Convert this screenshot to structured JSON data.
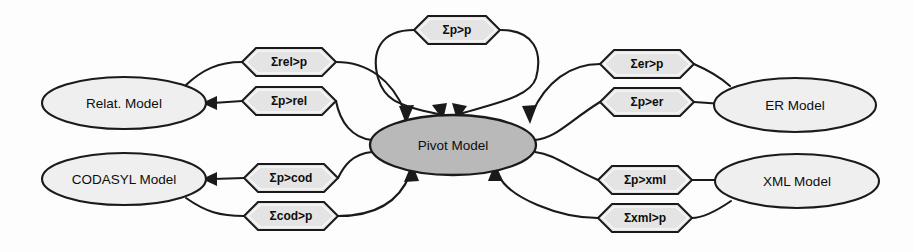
{
  "diagram": {
    "type": "pivot-model-transformation-diagram",
    "background_color": "#fdfdfd",
    "stroke_color": "#1a1a1a",
    "node_fill_color": "#efefef",
    "pivot_fill_color": "#b9b9b9",
    "hexagon_fill_color": "#e4e4e4",
    "nodes": [
      {
        "id": "relational",
        "label": "Relat. Model",
        "position": "top-left",
        "cx": 124,
        "cy": 103,
        "rx": 82,
        "ry": 26
      },
      {
        "id": "codasyl",
        "label": "CODASYL Model",
        "position": "bottom-left",
        "cx": 124,
        "cy": 179,
        "rx": 82,
        "ry": 26
      },
      {
        "id": "pivot",
        "label": "Pivot Model",
        "position": "center",
        "cx": 453,
        "cy": 145,
        "rx": 83,
        "ry": 30
      },
      {
        "id": "er",
        "label": "ER Model",
        "position": "top-right",
        "cx": 795,
        "cy": 105,
        "rx": 81,
        "ry": 27
      },
      {
        "id": "xml",
        "label": "XML Model",
        "position": "bottom-right",
        "cx": 797,
        "cy": 181,
        "rx": 82,
        "ry": 27
      }
    ],
    "transformations": [
      {
        "id": "rel-to-p",
        "label": "Σrel>p",
        "from": "relational",
        "to": "pivot",
        "cx": 289,
        "cy": 62
      },
      {
        "id": "p-to-rel",
        "label": "Σp>rel",
        "from": "pivot",
        "to": "relational",
        "cx": 289,
        "cy": 101
      },
      {
        "id": "p-to-p",
        "label": "Σp>p",
        "from": "pivot",
        "to": "pivot",
        "cx": 457,
        "cy": 30
      },
      {
        "id": "er-to-p",
        "label": "Σer>p",
        "from": "er",
        "to": "pivot",
        "cx": 647,
        "cy": 64
      },
      {
        "id": "p-to-er",
        "label": "Σp>er",
        "from": "pivot",
        "to": "er",
        "cx": 647,
        "cy": 102
      },
      {
        "id": "p-to-cod",
        "label": "Σp>cod",
        "from": "pivot",
        "to": "codasyl",
        "cx": 291,
        "cy": 178
      },
      {
        "id": "cod-to-p",
        "label": "Σcod>p",
        "from": "codasyl",
        "to": "pivot",
        "cx": 291,
        "cy": 216
      },
      {
        "id": "p-to-xml",
        "label": "Σp>xml",
        "from": "pivot",
        "to": "xml",
        "cx": 645,
        "cy": 180
      },
      {
        "id": "xml-to-p",
        "label": "Σxml>p",
        "from": "xml",
        "to": "pivot",
        "cx": 645,
        "cy": 218
      }
    ]
  }
}
